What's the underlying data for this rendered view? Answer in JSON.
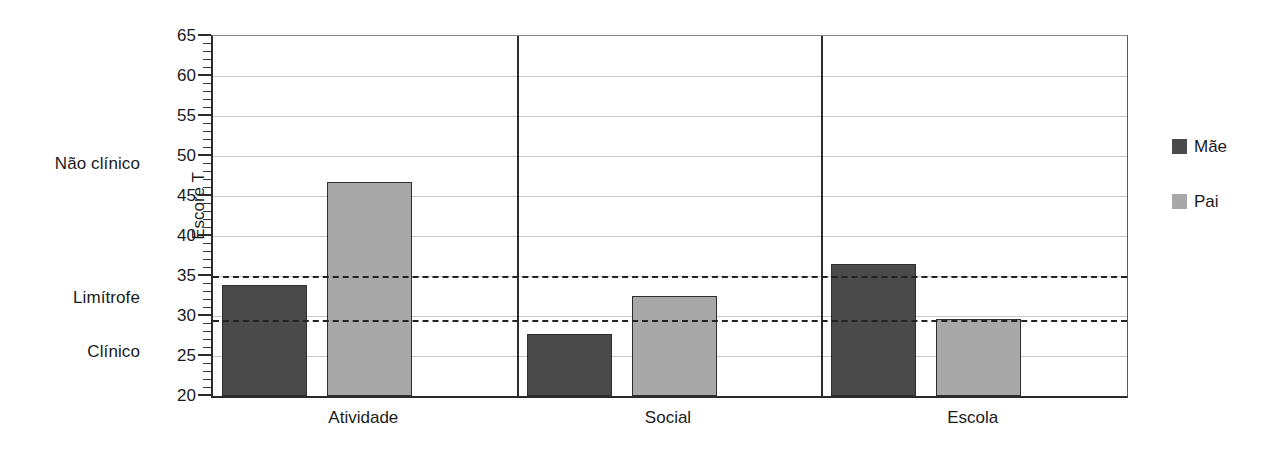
{
  "chart_data": {
    "type": "bar",
    "title": "",
    "xlabel": "",
    "ylabel": "Escore T",
    "categories": [
      "Atividade",
      "Social",
      "Escola"
    ],
    "series": [
      {
        "name": "Mãe",
        "color": "#4a4a4a",
        "values": [
          33.9,
          27.8,
          36.5
        ]
      },
      {
        "name": "Pai",
        "color": "#a8a8a8",
        "values": [
          46.8,
          32.5,
          29.6
        ]
      }
    ],
    "ylim": [
      20,
      65
    ],
    "y_ticks": [
      20,
      25,
      30,
      35,
      40,
      45,
      50,
      55,
      60,
      65
    ],
    "y_tick_labels": [
      "20",
      "25",
      "30",
      "35",
      "40",
      "45",
      "50",
      "55",
      "60",
      "65"
    ],
    "y_minor_tick_step": 1,
    "grid": true,
    "grid_axis": "y",
    "legend_position": "right",
    "reference_lines": [
      {
        "value": 35,
        "style": "dashed",
        "color": "#232323"
      },
      {
        "value": 29.5,
        "style": "dashed",
        "color": "#232323"
      }
    ],
    "band_labels": [
      {
        "label": "Não clínico",
        "value": 49
      },
      {
        "label": "Limítrofe",
        "value": 32.2
      },
      {
        "label": "Clínico",
        "value": 25.5
      }
    ],
    "group_dividers": [
      1,
      2
    ]
  },
  "legend": {
    "entries": [
      {
        "label": "Mãe",
        "color": "#4a4a4a"
      },
      {
        "label": "Pai",
        "color": "#a8a8a8"
      }
    ]
  },
  "axis": {
    "y_title": "Escore T"
  }
}
